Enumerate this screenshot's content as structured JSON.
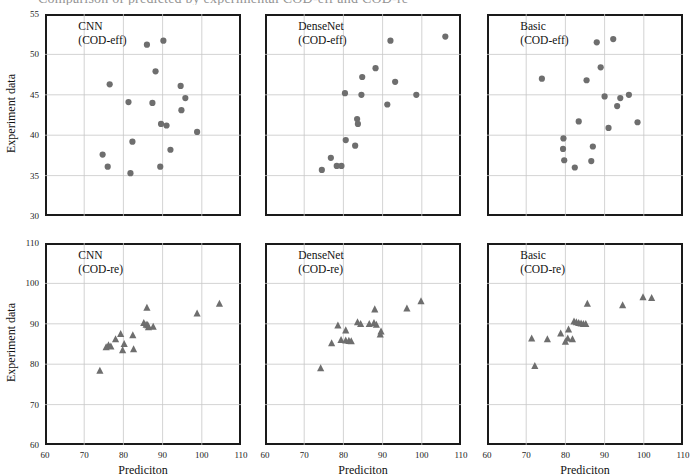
{
  "figure": {
    "caption_remnant": "Comparison of predicted by experimental COD-eff and COD-re",
    "marker_color_top": "#6e6e6e",
    "marker_color_bottom": "#6e6e6e",
    "frame_color": "#1a1a1a",
    "grid_color": "#c8c8c8"
  },
  "axes": {
    "xlabel": "Prediciton",
    "ylabel": "Experiment data",
    "x_ticks": [
      60,
      70,
      80,
      90,
      100,
      110
    ],
    "x_range": [
      60,
      110
    ],
    "top_y_ticks": [
      30,
      35,
      40,
      45,
      50,
      55
    ],
    "top_y_range": [
      30,
      55
    ],
    "bottom_y_ticks": [
      60,
      70,
      80,
      90,
      100,
      110
    ],
    "bottom_y_range": [
      60,
      110
    ]
  },
  "chart_data": [
    {
      "type": "scatter",
      "panel": "top-left",
      "title": "CNN",
      "subtitle": "(COD-eff)",
      "marker": "circle",
      "xlabel": "Prediciton",
      "ylabel": "Experiment data",
      "xlim": [
        60,
        110
      ],
      "ylim": [
        30,
        55
      ],
      "grid": true,
      "points": [
        {
          "x": 86.0,
          "y": 51.2
        },
        {
          "x": 90.2,
          "y": 51.7
        },
        {
          "x": 88.2,
          "y": 47.9
        },
        {
          "x": 76.5,
          "y": 46.3
        },
        {
          "x": 94.6,
          "y": 46.1
        },
        {
          "x": 95.8,
          "y": 44.6
        },
        {
          "x": 81.3,
          "y": 44.1
        },
        {
          "x": 87.4,
          "y": 44.0
        },
        {
          "x": 94.8,
          "y": 43.1
        },
        {
          "x": 89.6,
          "y": 41.4
        },
        {
          "x": 91.0,
          "y": 41.2
        },
        {
          "x": 98.8,
          "y": 40.4
        },
        {
          "x": 82.3,
          "y": 39.2
        },
        {
          "x": 92.0,
          "y": 38.2
        },
        {
          "x": 74.7,
          "y": 37.6
        },
        {
          "x": 76.0,
          "y": 36.1
        },
        {
          "x": 89.4,
          "y": 36.1
        },
        {
          "x": 81.8,
          "y": 35.3
        }
      ]
    },
    {
      "type": "scatter",
      "panel": "top-middle",
      "title": "DenseNet",
      "subtitle": "(COD-eff)",
      "marker": "circle",
      "xlabel": "Prediciton",
      "ylabel": "Experiment data",
      "xlim": [
        60,
        110
      ],
      "ylim": [
        30,
        55
      ],
      "grid": true,
      "points": [
        {
          "x": 92.0,
          "y": 51.7
        },
        {
          "x": 106.0,
          "y": 52.2
        },
        {
          "x": 88.2,
          "y": 48.3
        },
        {
          "x": 84.8,
          "y": 47.2
        },
        {
          "x": 93.2,
          "y": 46.6
        },
        {
          "x": 80.4,
          "y": 45.2
        },
        {
          "x": 84.6,
          "y": 45.0
        },
        {
          "x": 98.6,
          "y": 45.0
        },
        {
          "x": 91.2,
          "y": 43.8
        },
        {
          "x": 83.5,
          "y": 42.0
        },
        {
          "x": 83.7,
          "y": 41.4
        },
        {
          "x": 80.6,
          "y": 39.4
        },
        {
          "x": 83.0,
          "y": 38.7
        },
        {
          "x": 76.8,
          "y": 37.2
        },
        {
          "x": 78.3,
          "y": 36.2
        },
        {
          "x": 79.5,
          "y": 36.2
        },
        {
          "x": 74.5,
          "y": 35.7
        }
      ]
    },
    {
      "type": "scatter",
      "panel": "top-right",
      "title": "Basic",
      "subtitle": "(COD-eff)",
      "marker": "circle",
      "xlabel": "Prediciton",
      "ylabel": "Experiment data",
      "xlim": [
        60,
        110
      ],
      "ylim": [
        30,
        55
      ],
      "grid": true,
      "points": [
        {
          "x": 88.0,
          "y": 51.5
        },
        {
          "x": 92.2,
          "y": 51.9
        },
        {
          "x": 89.0,
          "y": 48.4
        },
        {
          "x": 74.0,
          "y": 47.0
        },
        {
          "x": 85.4,
          "y": 46.8
        },
        {
          "x": 90.0,
          "y": 44.8
        },
        {
          "x": 94.0,
          "y": 44.6
        },
        {
          "x": 96.2,
          "y": 45.0
        },
        {
          "x": 93.2,
          "y": 43.6
        },
        {
          "x": 83.4,
          "y": 41.7
        },
        {
          "x": 91.0,
          "y": 40.9
        },
        {
          "x": 98.4,
          "y": 41.6
        },
        {
          "x": 79.5,
          "y": 39.6
        },
        {
          "x": 79.4,
          "y": 38.3
        },
        {
          "x": 87.0,
          "y": 38.6
        },
        {
          "x": 79.7,
          "y": 36.9
        },
        {
          "x": 86.6,
          "y": 36.8
        },
        {
          "x": 82.4,
          "y": 36.0
        }
      ]
    },
    {
      "type": "scatter",
      "panel": "bottom-left",
      "title": "CNN",
      "subtitle": "(COD-re)",
      "marker": "triangle",
      "xlabel": "Prediciton",
      "ylabel": "Experiment data",
      "xlim": [
        60,
        110
      ],
      "ylim": [
        60,
        110
      ],
      "grid": true,
      "points": [
        {
          "x": 104.5,
          "y": 95.0
        },
        {
          "x": 98.8,
          "y": 92.6
        },
        {
          "x": 86.0,
          "y": 94.0
        },
        {
          "x": 85.2,
          "y": 90.2
        },
        {
          "x": 85.8,
          "y": 89.8
        },
        {
          "x": 86.2,
          "y": 89.7
        },
        {
          "x": 86.4,
          "y": 89.2
        },
        {
          "x": 87.6,
          "y": 89.3
        },
        {
          "x": 79.3,
          "y": 87.5
        },
        {
          "x": 82.4,
          "y": 87.2
        },
        {
          "x": 78.0,
          "y": 86.2
        },
        {
          "x": 80.2,
          "y": 85.0
        },
        {
          "x": 76.2,
          "y": 84.7
        },
        {
          "x": 76.8,
          "y": 84.4
        },
        {
          "x": 75.6,
          "y": 84.2
        },
        {
          "x": 79.8,
          "y": 83.5
        },
        {
          "x": 82.6,
          "y": 83.7
        },
        {
          "x": 74.0,
          "y": 78.4
        }
      ]
    },
    {
      "type": "scatter",
      "panel": "bottom-middle",
      "title": "DenseNet",
      "subtitle": "(COD-re)",
      "marker": "triangle",
      "xlabel": "Prediciton",
      "ylabel": "Experiment data",
      "xlim": [
        60,
        110
      ],
      "ylim": [
        60,
        110
      ],
      "grid": true,
      "points": [
        {
          "x": 99.8,
          "y": 95.6
        },
        {
          "x": 96.2,
          "y": 93.8
        },
        {
          "x": 88.0,
          "y": 93.6
        },
        {
          "x": 83.6,
          "y": 90.4
        },
        {
          "x": 84.4,
          "y": 90.0
        },
        {
          "x": 86.6,
          "y": 90.0
        },
        {
          "x": 87.8,
          "y": 90.2
        },
        {
          "x": 88.4,
          "y": 89.8
        },
        {
          "x": 78.6,
          "y": 89.6
        },
        {
          "x": 80.6,
          "y": 88.4
        },
        {
          "x": 89.6,
          "y": 88.1
        },
        {
          "x": 89.4,
          "y": 87.4
        },
        {
          "x": 79.4,
          "y": 86.0
        },
        {
          "x": 80.6,
          "y": 85.9
        },
        {
          "x": 81.4,
          "y": 85.8
        },
        {
          "x": 82.0,
          "y": 85.7
        },
        {
          "x": 77.0,
          "y": 85.2
        },
        {
          "x": 74.2,
          "y": 79.0
        }
      ]
    },
    {
      "type": "scatter",
      "panel": "bottom-right",
      "title": "Basic",
      "subtitle": "(COD-re)",
      "marker": "triangle",
      "xlabel": "Prediciton",
      "ylabel": "Experiment data",
      "xlim": [
        60,
        110
      ],
      "ylim": [
        60,
        110
      ],
      "grid": true,
      "points": [
        {
          "x": 99.8,
          "y": 96.6
        },
        {
          "x": 102.0,
          "y": 96.4
        },
        {
          "x": 94.6,
          "y": 94.6
        },
        {
          "x": 85.6,
          "y": 95.0
        },
        {
          "x": 82.2,
          "y": 90.6
        },
        {
          "x": 82.8,
          "y": 90.4
        },
        {
          "x": 83.4,
          "y": 90.2
        },
        {
          "x": 84.0,
          "y": 90.1
        },
        {
          "x": 84.6,
          "y": 90.0
        },
        {
          "x": 85.2,
          "y": 90.0
        },
        {
          "x": 80.8,
          "y": 88.6
        },
        {
          "x": 78.8,
          "y": 87.6
        },
        {
          "x": 80.6,
          "y": 86.4
        },
        {
          "x": 81.8,
          "y": 86.2
        },
        {
          "x": 71.4,
          "y": 86.4
        },
        {
          "x": 75.4,
          "y": 86.2
        },
        {
          "x": 80.0,
          "y": 85.6
        },
        {
          "x": 72.2,
          "y": 79.6
        }
      ]
    }
  ]
}
